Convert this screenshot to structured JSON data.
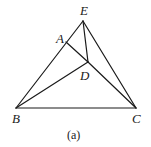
{
  "figure": {
    "caption": "(a)",
    "points": {
      "A": {
        "label": "A",
        "x": 66,
        "y": 42
      },
      "B": {
        "label": "B",
        "x": 16,
        "y": 108
      },
      "C": {
        "label": "C",
        "x": 136,
        "y": 108
      },
      "D": {
        "label": "D",
        "x": 88,
        "y": 62
      },
      "E": {
        "label": "E",
        "x": 83,
        "y": 21
      }
    },
    "segments": [
      [
        "B",
        "E"
      ],
      [
        "E",
        "C"
      ],
      [
        "B",
        "C"
      ],
      [
        "E",
        "D"
      ],
      [
        "A",
        "D"
      ],
      [
        "B",
        "D"
      ],
      [
        "D",
        "C"
      ]
    ],
    "line_color": "#1a1a1a"
  }
}
